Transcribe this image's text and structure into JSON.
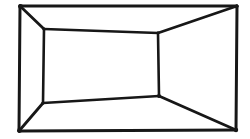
{
  "figure": {
    "style": "ink-on-paper line drawing",
    "background_color": "#ffffff",
    "line_color": "#171717",
    "outer_stroke_width": 3.0,
    "inner_stroke_width": 2.6,
    "diagonal_stroke_width": 2.8,
    "canvas": {
      "width": 250,
      "height": 139
    },
    "outer_frame": {
      "name": "outer-rectangle",
      "points": [
        {
          "label": "top-left",
          "x": 20,
          "y": 6
        },
        {
          "label": "top-right",
          "x": 237,
          "y": 6
        },
        {
          "label": "bottom-right",
          "x": 236,
          "y": 130
        },
        {
          "label": "bottom-left",
          "x": 19,
          "y": 131
        }
      ],
      "path": "M 20 6 L 237 6 L 236 130 L 19 131 Z"
    },
    "inner_frame": {
      "name": "inner-rectangle-back-wall",
      "points": [
        {
          "label": "top-left",
          "x": 44,
          "y": 29
        },
        {
          "label": "top-right",
          "x": 158,
          "y": 33
        },
        {
          "label": "bottom-right",
          "x": 159,
          "y": 96
        },
        {
          "label": "bottom-left",
          "x": 43,
          "y": 103
        }
      ],
      "path": "M 44 29 L 158 33 L 159 96 L 43 103 Z"
    },
    "diagonals": [
      {
        "name": "diagonal-top-left",
        "path": "M 20 6 L 44 29"
      },
      {
        "name": "diagonal-top-right",
        "path": "M 237 6 L 158 33"
      },
      {
        "name": "diagonal-bottom-right",
        "path": "M 236 130 L 159 96"
      },
      {
        "name": "diagonal-bottom-left",
        "path": "M 19 131 L 43 103"
      }
    ],
    "edge_labels": {
      "outer_top": "outer-top-edge",
      "outer_right": "outer-right-edge",
      "outer_bottom": "outer-bottom-edge",
      "outer_left": "outer-left-edge",
      "inner_top": "inner-top-edge",
      "inner_right": "inner-right-edge",
      "inner_bottom": "inner-bottom-edge",
      "inner_left": "inner-left-edge"
    }
  }
}
